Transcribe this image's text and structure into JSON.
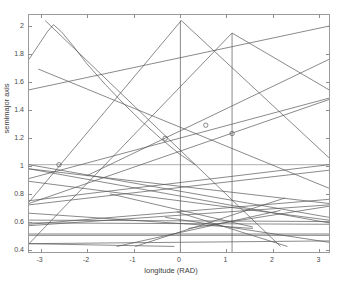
{
  "figure": {
    "title_ghost": "",
    "background": "#ffffff",
    "line_color": "#555555",
    "axis_color": "#9a9a9a"
  },
  "axes": {
    "xlabel": "longitude (RAD)",
    "ylabel": "semimajor axis",
    "xticklabels": [
      "-3",
      "-2",
      "-1",
      "0",
      "1",
      "2",
      "3"
    ],
    "yticklabels": [
      "0.4",
      "0.6",
      "0.8",
      "1",
      "1.2",
      "1.4",
      "1.6",
      "1.8",
      "2"
    ]
  },
  "chart_data": {
    "type": "line",
    "title": "",
    "xlabel": "longitude (RAD)",
    "ylabel": "semimajor axis",
    "xlim": [
      -3.25,
      3.25
    ],
    "ylim": [
      0.37,
      2.08
    ],
    "xticks": [
      -3,
      -2,
      -1,
      0,
      1,
      2,
      3
    ],
    "yticks": [
      0.4,
      0.6,
      0.8,
      1.0,
      1.2,
      1.4,
      1.6,
      1.8,
      2.0
    ],
    "grid": false,
    "legend": null,
    "series": [
      {
        "name": "vline-0",
        "type": "vertical",
        "x": 0.03,
        "y_range": [
          0.37,
          2.04
        ]
      },
      {
        "name": "vline-1",
        "type": "vertical",
        "x": 1.15,
        "y_range": [
          0.37,
          1.95
        ]
      },
      {
        "name": "unit-semimajor",
        "type": "horizontal",
        "y": 1.0,
        "x_range": [
          -3.25,
          3.25
        ]
      },
      {
        "name": "curve-1",
        "type": "curve",
        "x": [
          -3.25,
          -3.05,
          -2.85,
          -2.72,
          -2.55,
          -2.3,
          -2.0,
          -1.6,
          -1.2,
          -0.8,
          -0.4,
          0.0,
          0.35
        ],
        "y": [
          1.76,
          1.86,
          1.96,
          2.01,
          1.96,
          1.86,
          1.73,
          1.58,
          1.44,
          1.31,
          1.19,
          1.08,
          1.0
        ]
      },
      {
        "name": "line-a",
        "type": "line",
        "x": [
          -3.05,
          3.25
        ],
        "y": [
          1.69,
          0.83
        ]
      },
      {
        "name": "line-b",
        "type": "line",
        "x": [
          -3.25,
          3.25
        ],
        "y": [
          1.54,
          2.0
        ]
      },
      {
        "name": "line-c",
        "type": "line",
        "x": [
          -2.9,
          2.2
        ],
        "y": [
          2.04,
          0.41
        ]
      },
      {
        "name": "line-d",
        "type": "line",
        "x": [
          -2.0,
          3.25
        ],
        "y": [
          0.92,
          1.76
        ]
      },
      {
        "name": "line-e",
        "type": "line",
        "x": [
          -3.25,
          0.05
        ],
        "y": [
          0.73,
          2.04
        ]
      },
      {
        "name": "line-f",
        "type": "line",
        "x": [
          0.05,
          3.25
        ],
        "y": [
          2.04,
          1.05
        ]
      },
      {
        "name": "line-g",
        "type": "line",
        "x": [
          -3.25,
          1.15
        ],
        "y": [
          0.43,
          1.95
        ]
      },
      {
        "name": "line-h",
        "type": "line",
        "x": [
          1.15,
          3.25
        ],
        "y": [
          1.95,
          1.54
        ]
      },
      {
        "name": "line-i",
        "type": "line",
        "x": [
          -3.25,
          3.25
        ],
        "y": [
          0.72,
          1.47
        ]
      },
      {
        "name": "line-j",
        "type": "line",
        "x": [
          -3.25,
          3.25
        ],
        "y": [
          0.9,
          1.48
        ]
      },
      {
        "name": "line-k",
        "type": "line",
        "x": [
          -3.25,
          3.25
        ],
        "y": [
          1.0,
          0.62
        ]
      },
      {
        "name": "line-l",
        "type": "line",
        "x": [
          -3.25,
          3.25
        ],
        "y": [
          0.97,
          0.58
        ]
      },
      {
        "name": "line-m",
        "type": "line",
        "x": [
          -3.25,
          3.25
        ],
        "y": [
          0.74,
          1.0
        ]
      },
      {
        "name": "line-n",
        "type": "line",
        "x": [
          -3.25,
          3.25
        ],
        "y": [
          0.71,
          0.96
        ]
      },
      {
        "name": "line-o",
        "type": "line",
        "x": [
          -3.25,
          3.25
        ],
        "y": [
          0.97,
          0.72
        ]
      },
      {
        "name": "line-p",
        "type": "line",
        "x": [
          -3.25,
          3.25
        ],
        "y": [
          0.88,
          0.6
        ]
      },
      {
        "name": "line-q",
        "type": "line",
        "x": [
          -3.25,
          3.25
        ],
        "y": [
          0.57,
          0.75
        ]
      },
      {
        "name": "line-r",
        "type": "line",
        "x": [
          -3.25,
          3.25
        ],
        "y": [
          0.56,
          0.71
        ]
      },
      {
        "name": "line-s",
        "type": "line",
        "x": [
          -3.25,
          3.25
        ],
        "y": [
          0.6,
          0.59
        ]
      },
      {
        "name": "line-t",
        "type": "line",
        "x": [
          -3.25,
          3.25
        ],
        "y": [
          0.58,
          0.57
        ]
      },
      {
        "name": "line-u",
        "type": "line",
        "x": [
          -3.25,
          3.25
        ],
        "y": [
          0.5,
          0.5
        ]
      },
      {
        "name": "line-v",
        "type": "line",
        "x": [
          -3.25,
          3.25
        ],
        "y": [
          0.49,
          0.49
        ]
      },
      {
        "name": "line-w",
        "type": "line",
        "x": [
          -3.25,
          3.25
        ],
        "y": [
          0.43,
          0.45
        ]
      },
      {
        "name": "line-x",
        "type": "line",
        "x": [
          -3.25,
          -0.1
        ],
        "y": [
          0.43,
          0.41
        ]
      },
      {
        "name": "line-y",
        "type": "line",
        "x": [
          -1.35,
          2.2
        ],
        "y": [
          0.41,
          0.67
        ]
      },
      {
        "name": "line-z",
        "type": "line",
        "x": [
          -0.95,
          2.3
        ],
        "y": [
          0.41,
          0.76
        ]
      },
      {
        "name": "line-aa",
        "type": "line",
        "x": [
          -0.05,
          2.35
        ],
        "y": [
          0.66,
          0.41
        ]
      },
      {
        "name": "line-ab",
        "type": "line",
        "x": [
          -1.5,
          1.6
        ],
        "y": [
          0.79,
          0.55
        ]
      },
      {
        "name": "line-ac",
        "type": "line",
        "x": [
          -3.25,
          1.6
        ],
        "y": [
          0.65,
          0.54
        ]
      },
      {
        "name": "line-ad",
        "type": "line",
        "x": [
          0.2,
          3.25
        ],
        "y": [
          0.54,
          0.7
        ]
      },
      {
        "name": "line-ae",
        "type": "line",
        "x": [
          -0.3,
          3.25
        ],
        "y": [
          0.62,
          0.44
        ]
      }
    ],
    "markers": [
      {
        "name": "marker-1",
        "x": -2.6,
        "y": 1.0,
        "shape": "circle"
      },
      {
        "name": "marker-2",
        "x": -0.3,
        "y": 1.19,
        "shape": "circle"
      },
      {
        "name": "marker-3",
        "x": 0.58,
        "y": 1.285,
        "shape": "circle"
      },
      {
        "name": "marker-4",
        "x": 1.15,
        "y": 1.225,
        "shape": "circle"
      }
    ]
  }
}
